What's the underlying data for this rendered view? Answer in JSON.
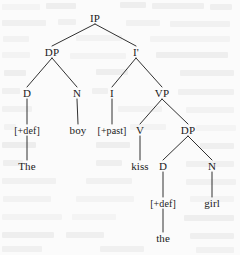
{
  "figure": {
    "kind": "syntax-tree",
    "theory": "X-bar phrase structure",
    "sentence": "The boy kissed the girl",
    "background_color": "#fbfbfb",
    "ink_color": "#1a1a1a"
  },
  "nodes": [
    {
      "id": "IP",
      "label": "IP",
      "x": 95,
      "y": 18,
      "type": "phrase"
    },
    {
      "id": "DP1",
      "label": "DP",
      "x": 52,
      "y": 52,
      "type": "phrase"
    },
    {
      "id": "Ibar",
      "label": "I'",
      "x": 136,
      "y": 52,
      "type": "bar"
    },
    {
      "id": "D1",
      "label": "D",
      "x": 27,
      "y": 93,
      "type": "head"
    },
    {
      "id": "N1",
      "label": "N",
      "x": 77,
      "y": 93,
      "type": "head"
    },
    {
      "id": "I1",
      "label": "I",
      "x": 112,
      "y": 93,
      "type": "head"
    },
    {
      "id": "VP",
      "label": "VP",
      "x": 162,
      "y": 93,
      "type": "phrase"
    },
    {
      "id": "Ddef1",
      "label": "[+def]",
      "x": 27,
      "y": 130,
      "type": "feature"
    },
    {
      "id": "boy",
      "label": "boy",
      "x": 78,
      "y": 130,
      "type": "word"
    },
    {
      "id": "past",
      "label": "[+past]",
      "x": 112,
      "y": 130,
      "type": "feature"
    },
    {
      "id": "V",
      "label": "V",
      "x": 140,
      "y": 130,
      "type": "head"
    },
    {
      "id": "DP2",
      "label": "DP",
      "x": 188,
      "y": 130,
      "type": "phrase"
    },
    {
      "id": "The",
      "label": "The",
      "x": 27,
      "y": 166,
      "type": "word"
    },
    {
      "id": "kiss",
      "label": "kiss",
      "x": 140,
      "y": 166,
      "type": "word"
    },
    {
      "id": "D2",
      "label": "D",
      "x": 163,
      "y": 166,
      "type": "head"
    },
    {
      "id": "N2",
      "label": "N",
      "x": 212,
      "y": 166,
      "type": "head"
    },
    {
      "id": "Ddef2",
      "label": "[+def]",
      "x": 163,
      "y": 203,
      "type": "feature"
    },
    {
      "id": "girl",
      "label": "girl",
      "x": 212,
      "y": 203,
      "type": "word"
    },
    {
      "id": "the",
      "label": "the",
      "x": 163,
      "y": 238,
      "type": "word"
    }
  ],
  "edges": [
    {
      "from": "IP",
      "to": "DP1"
    },
    {
      "from": "IP",
      "to": "Ibar"
    },
    {
      "from": "DP1",
      "to": "D1"
    },
    {
      "from": "DP1",
      "to": "N1"
    },
    {
      "from": "Ibar",
      "to": "I1"
    },
    {
      "from": "Ibar",
      "to": "VP"
    },
    {
      "from": "D1",
      "to": "Ddef1"
    },
    {
      "from": "N1",
      "to": "boy"
    },
    {
      "from": "I1",
      "to": "past"
    },
    {
      "from": "VP",
      "to": "V"
    },
    {
      "from": "VP",
      "to": "DP2"
    },
    {
      "from": "Ddef1",
      "to": "The"
    },
    {
      "from": "V",
      "to": "kiss"
    },
    {
      "from": "DP2",
      "to": "D2"
    },
    {
      "from": "DP2",
      "to": "N2"
    },
    {
      "from": "D2",
      "to": "Ddef2"
    },
    {
      "from": "N2",
      "to": "girl"
    },
    {
      "from": "Ddef2",
      "to": "the"
    }
  ],
  "scan_bleed": [
    {
      "x": 2,
      "y": 4,
      "w": 38,
      "h": 6
    },
    {
      "x": 46,
      "y": 3,
      "w": 30,
      "h": 6
    },
    {
      "x": 120,
      "y": 2,
      "w": 26,
      "h": 6
    },
    {
      "x": 152,
      "y": 3,
      "w": 52,
      "h": 6
    },
    {
      "x": 210,
      "y": 4,
      "w": 22,
      "h": 6
    },
    {
      "x": 2,
      "y": 20,
      "w": 44,
      "h": 6
    },
    {
      "x": 58,
      "y": 19,
      "w": 18,
      "h": 6
    },
    {
      "x": 126,
      "y": 20,
      "w": 34,
      "h": 6
    },
    {
      "x": 170,
      "y": 21,
      "w": 60,
      "h": 6
    },
    {
      "x": 3,
      "y": 36,
      "w": 26,
      "h": 6
    },
    {
      "x": 76,
      "y": 35,
      "w": 46,
      "h": 6
    },
    {
      "x": 150,
      "y": 36,
      "w": 80,
      "h": 6
    },
    {
      "x": 2,
      "y": 52,
      "w": 28,
      "h": 6
    },
    {
      "x": 70,
      "y": 53,
      "w": 56,
      "h": 6
    },
    {
      "x": 156,
      "y": 52,
      "w": 72,
      "h": 6
    },
    {
      "x": 4,
      "y": 70,
      "w": 22,
      "h": 6
    },
    {
      "x": 96,
      "y": 69,
      "w": 32,
      "h": 6
    },
    {
      "x": 180,
      "y": 70,
      "w": 54,
      "h": 6
    },
    {
      "x": 2,
      "y": 88,
      "w": 18,
      "h": 6
    },
    {
      "x": 92,
      "y": 88,
      "w": 16,
      "h": 6
    },
    {
      "x": 178,
      "y": 89,
      "w": 56,
      "h": 6
    },
    {
      "x": 2,
      "y": 106,
      "w": 30,
      "h": 6
    },
    {
      "x": 118,
      "y": 106,
      "w": 44,
      "h": 6
    },
    {
      "x": 186,
      "y": 107,
      "w": 48,
      "h": 6
    },
    {
      "x": 4,
      "y": 124,
      "w": 12,
      "h": 6
    },
    {
      "x": 130,
      "y": 124,
      "w": 36,
      "h": 6
    },
    {
      "x": 196,
      "y": 125,
      "w": 40,
      "h": 6
    },
    {
      "x": 2,
      "y": 142,
      "w": 34,
      "h": 6
    },
    {
      "x": 96,
      "y": 142,
      "w": 34,
      "h": 6
    },
    {
      "x": 200,
      "y": 143,
      "w": 34,
      "h": 6
    },
    {
      "x": 3,
      "y": 160,
      "w": 20,
      "h": 6
    },
    {
      "x": 96,
      "y": 160,
      "w": 26,
      "h": 6
    },
    {
      "x": 186,
      "y": 161,
      "w": 48,
      "h": 6
    },
    {
      "x": 2,
      "y": 178,
      "w": 54,
      "h": 6
    },
    {
      "x": 86,
      "y": 178,
      "w": 46,
      "h": 6
    },
    {
      "x": 186,
      "y": 179,
      "w": 50,
      "h": 6
    },
    {
      "x": 3,
      "y": 196,
      "w": 48,
      "h": 6
    },
    {
      "x": 76,
      "y": 196,
      "w": 58,
      "h": 6
    },
    {
      "x": 190,
      "y": 196,
      "w": 44,
      "h": 6
    },
    {
      "x": 2,
      "y": 214,
      "w": 60,
      "h": 6
    },
    {
      "x": 72,
      "y": 214,
      "w": 44,
      "h": 6
    },
    {
      "x": 184,
      "y": 215,
      "w": 50,
      "h": 6
    },
    {
      "x": 2,
      "y": 232,
      "w": 52,
      "h": 6
    },
    {
      "x": 66,
      "y": 232,
      "w": 38,
      "h": 6
    },
    {
      "x": 190,
      "y": 233,
      "w": 44,
      "h": 6
    },
    {
      "x": 2,
      "y": 246,
      "w": 40,
      "h": 6
    },
    {
      "x": 100,
      "y": 246,
      "w": 44,
      "h": 6
    },
    {
      "x": 196,
      "y": 247,
      "w": 38,
      "h": 6
    }
  ]
}
